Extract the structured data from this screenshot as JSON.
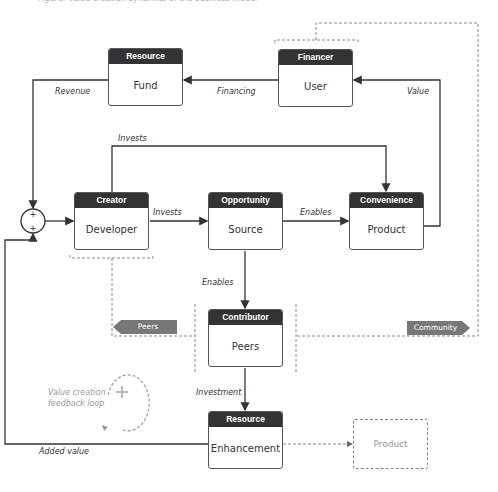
{
  "caption": "Figure: Value creation dynamics of the business model",
  "nodes": {
    "fund": {
      "role": "Resource",
      "name": "Fund"
    },
    "user": {
      "role": "Financer",
      "name": "User"
    },
    "developer": {
      "role": "Creator",
      "name": "Developer"
    },
    "source": {
      "role": "Opportunity",
      "name": "Source"
    },
    "product": {
      "role": "Convenience",
      "name": "Product"
    },
    "peers": {
      "role": "Contributor",
      "name": "Peers"
    },
    "enhancement": {
      "role": "Resource",
      "name": "Enhancement"
    }
  },
  "edges": {
    "revenue": "Revenue",
    "financing": "Financing",
    "value": "Value",
    "invests_top": "Invests",
    "invests": "Invests",
    "enables_right": "Enables",
    "enables_down": "Enables",
    "investment": "Investment",
    "added_value": "Added value"
  },
  "tags": {
    "peers": "Peers",
    "community": "Community"
  },
  "ghost_product": "Product",
  "loop_note": [
    "Value creation",
    "feedback loop"
  ],
  "sum_symbols": [
    "+",
    "+"
  ],
  "colors": {
    "header": "#333333",
    "line": "#333333",
    "dashed": "#888888",
    "tag": "#777777"
  }
}
